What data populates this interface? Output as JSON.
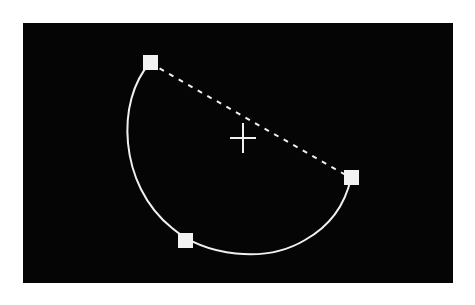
{
  "canvas": {
    "background": "#050505",
    "x": 23,
    "y": 23,
    "width": 430,
    "height": 260
  },
  "arc": {
    "color": "#f0f0f0",
    "start": [
      150,
      63
    ],
    "through": [
      124,
      135
    ],
    "mid": [
      185,
      241
    ],
    "bottom": [
      245,
      256
    ],
    "end": [
      351,
      178
    ],
    "center": [
      243,
      138
    ],
    "radius": 118
  },
  "chord": {
    "style": "dashed",
    "color": "#f0f0f0",
    "from": [
      150,
      63
    ],
    "to": [
      351,
      178
    ]
  },
  "crosshair": {
    "center": [
      243,
      138
    ],
    "color": "#f0f0f0"
  },
  "handles": [
    {
      "name": "start-handle",
      "x": 150,
      "y": 63
    },
    {
      "name": "mid-handle",
      "x": 185,
      "y": 241
    },
    {
      "name": "end-handle",
      "x": 351,
      "y": 178
    }
  ]
}
